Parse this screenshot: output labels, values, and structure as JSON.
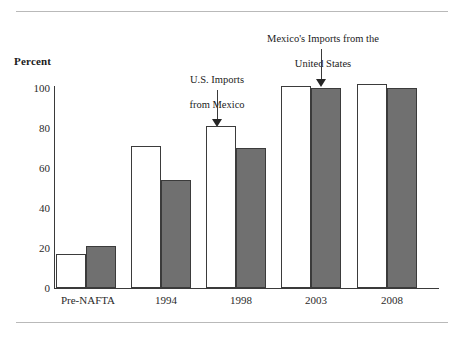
{
  "figure": {
    "axis_title": "Percent",
    "rules": {
      "color": "#b9b9b9"
    }
  },
  "chart_data": {
    "type": "bar",
    "title": "",
    "subtitle": "",
    "xlabel": "",
    "ylabel": "Percent",
    "ylim": [
      0,
      110
    ],
    "yticks": [
      0,
      20,
      40,
      60,
      80,
      100
    ],
    "ytick_labels": [
      "0",
      "20",
      "40",
      "60",
      "80",
      "100"
    ],
    "grid": false,
    "legend_position": "annotations",
    "categories": [
      "Pre-NAFTA",
      "1994",
      "1998",
      "2003",
      "2008"
    ],
    "series": [
      {
        "name": "U.S. Imports from Mexico",
        "color": "#ffffff",
        "edge_color": "#3b3b3b",
        "values": [
          17,
          71,
          81,
          101,
          102
        ]
      },
      {
        "name": "Mexico's Imports from the United States",
        "color": "#707070",
        "edge_color": "#3b3b3b",
        "values": [
          21,
          54,
          70,
          100,
          100
        ]
      }
    ],
    "annotations": [
      {
        "text": "U.S. Imports\nfrom Mexico",
        "points_to": {
          "category": "1998",
          "series": "U.S. Imports from Mexico"
        }
      },
      {
        "text": "Mexico's Imports from the\nUnited States",
        "points_to": {
          "category": "2003",
          "series": "Mexico's Imports from the United States"
        }
      }
    ]
  },
  "ticks": {
    "y": [
      "100",
      "80",
      "60",
      "40",
      "20",
      "0"
    ],
    "x": [
      "Pre-NAFTA",
      "1994",
      "1998",
      "2003",
      "2008"
    ]
  },
  "annotations": {
    "us_imports": {
      "line1": "U.S. Imports",
      "line2": "from Mexico"
    },
    "mexico_imports": {
      "line1": "Mexico's Imports from the",
      "line2": "United States"
    }
  }
}
